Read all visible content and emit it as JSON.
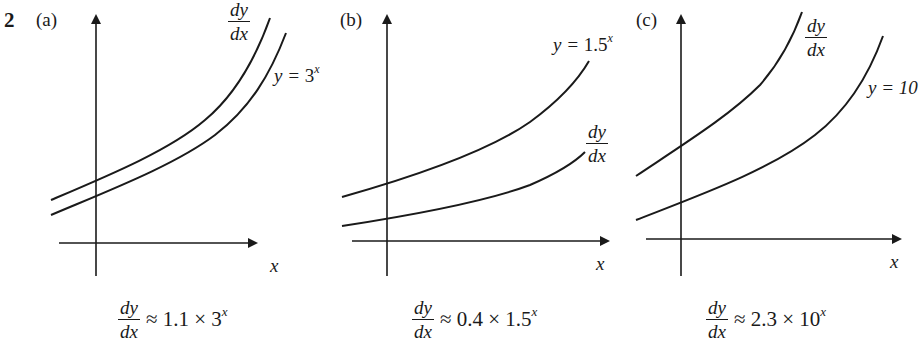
{
  "question_number": "2",
  "panels": [
    {
      "label": "(a)",
      "x_axis_label": "x",
      "curves": [
        {
          "name": "derivative",
          "label_num": "dy",
          "label_den": "dx"
        },
        {
          "name": "function",
          "label_prefix": "y = ",
          "label_base": "3",
          "label_exp": "x"
        }
      ],
      "formula": {
        "num": "dy",
        "den": "dx",
        "rhs_prefix": "≈ 1.1 × 3",
        "rhs_exp": "x"
      }
    },
    {
      "label": "(b)",
      "x_axis_label": "x",
      "curves": [
        {
          "name": "function",
          "label_prefix": "y = ",
          "label_base": "1.5",
          "label_exp": "x"
        },
        {
          "name": "derivative",
          "label_num": "dy",
          "label_den": "dx"
        }
      ],
      "formula": {
        "num": "dy",
        "den": "dx",
        "rhs_prefix": "≈ 0.4 × 1.5",
        "rhs_exp": "x"
      }
    },
    {
      "label": "(c)",
      "x_axis_label": "x",
      "curves": [
        {
          "name": "derivative",
          "label_num": "dy",
          "label_den": "dx"
        },
        {
          "name": "function",
          "label_prefix": "y = 10",
          "label_base": "",
          "label_exp": ""
        }
      ],
      "formula": {
        "num": "dy",
        "den": "dx",
        "rhs_prefix": "≈ 2.3 × 10",
        "rhs_exp": "x"
      }
    }
  ],
  "colors": {
    "ink": "#1a1a1a",
    "background": "#ffffff"
  }
}
